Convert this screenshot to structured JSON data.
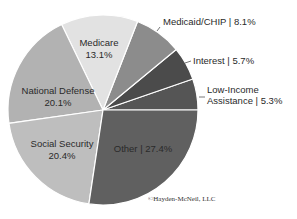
{
  "chart_data": {
    "type": "pie",
    "title": "",
    "start": "3 o'clock, counterclockwise",
    "slices": [
      {
        "label": "Low-Income Assistance",
        "value": 5.3,
        "color": "#555555",
        "inside": false,
        "label_lines": [
          "Low-Income",
          "Assistance | 5.3%"
        ]
      },
      {
        "label": "Interest",
        "value": 5.7,
        "color": "#4b4b4b",
        "inside": false,
        "label_lines": [
          "Interest | 5.7%"
        ]
      },
      {
        "label": "Medicaid/CHIP",
        "value": 8.1,
        "color": "#8c8c8c",
        "inside": false,
        "label_lines": [
          "Medicaid/CHIP | 8.1%"
        ]
      },
      {
        "label": "Medicare",
        "value": 13.1,
        "color": "#e2e2e2",
        "inside": true,
        "label_lines": [
          "Medicare",
          "13.1%"
        ]
      },
      {
        "label": "National Defense",
        "value": 20.1,
        "color": "#b2b2b2",
        "inside": true,
        "label_lines": [
          "National Defense",
          "20.1%"
        ]
      },
      {
        "label": "Social Security",
        "value": 20.4,
        "color": "#bebebe",
        "inside": true,
        "label_lines": [
          "Social Security",
          "20.4%"
        ]
      },
      {
        "label": "Other",
        "value": 27.4,
        "color": "#606060",
        "inside": true,
        "label_lines": [
          "Other | 27.4%"
        ]
      }
    ]
  },
  "credit": "©Hayden-McNeil, LLC"
}
